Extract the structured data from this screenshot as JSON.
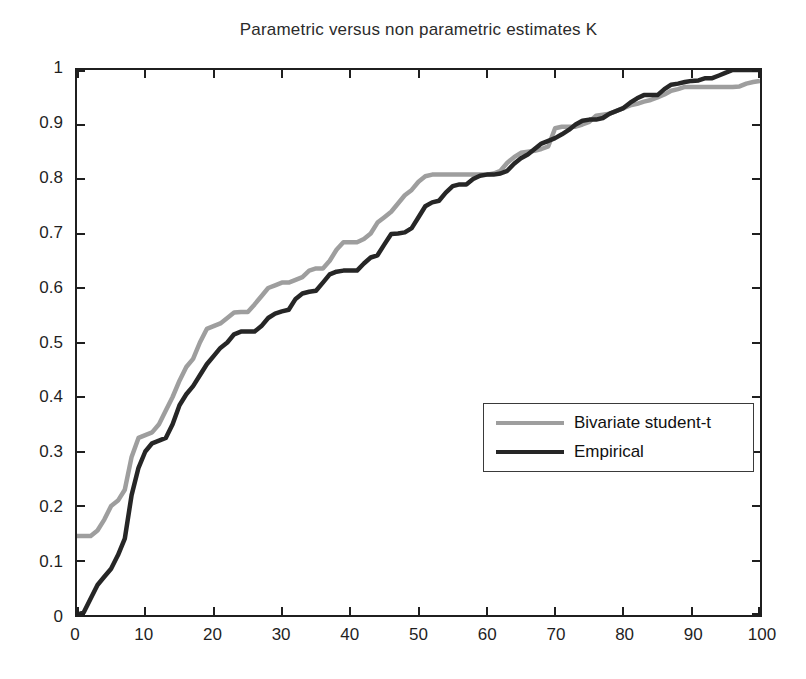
{
  "title": "Parametric versus non parametric estimates K",
  "legend": {
    "items": [
      {
        "label": "Bivariate student-t",
        "color": "#9e9e9e"
      },
      {
        "label": "Empirical",
        "color": "#262626"
      }
    ]
  },
  "axes": {
    "x": {
      "tick_values": [
        0,
        10,
        20,
        30,
        40,
        50,
        60,
        70,
        80,
        90,
        100
      ],
      "tick_labels": [
        "0",
        "10",
        "20",
        "30",
        "40",
        "50",
        "60",
        "70",
        "80",
        "90",
        "100"
      ]
    },
    "y": {
      "tick_values": [
        0,
        0.1,
        0.2,
        0.3,
        0.4,
        0.5,
        0.6,
        0.7,
        0.8,
        0.9,
        1
      ],
      "tick_labels": [
        "0",
        "0.1",
        "0.2",
        "0.3",
        "0.4",
        "0.5",
        "0.6",
        "0.7",
        "0.8",
        "0.9",
        "1"
      ]
    }
  },
  "chart_data": {
    "type": "line",
    "title": "Parametric versus non parametric estimates K",
    "xlabel": "",
    "ylabel": "",
    "xlim": [
      0,
      100
    ],
    "ylim": [
      0,
      1
    ],
    "grid": false,
    "legend_position": "inside lower-right",
    "frame_color": "#1f1f1f",
    "series": [
      {
        "name": "Bivariate student-t",
        "color": "#9e9e9e",
        "stroke_width": 4.5,
        "points": [
          [
            0,
            0.145
          ],
          [
            1,
            0.145
          ],
          [
            2,
            0.145
          ],
          [
            3,
            0.155
          ],
          [
            4,
            0.175
          ],
          [
            5,
            0.2
          ],
          [
            6,
            0.21
          ],
          [
            7,
            0.23
          ],
          [
            8,
            0.29
          ],
          [
            9,
            0.325
          ],
          [
            10,
            0.33
          ],
          [
            11,
            0.335
          ],
          [
            12,
            0.35
          ],
          [
            13,
            0.375
          ],
          [
            14,
            0.4
          ],
          [
            15,
            0.43
          ],
          [
            16,
            0.455
          ],
          [
            17,
            0.47
          ],
          [
            18,
            0.5
          ],
          [
            19,
            0.525
          ],
          [
            20,
            0.53
          ],
          [
            21,
            0.535
          ],
          [
            22,
            0.545
          ],
          [
            23,
            0.555
          ],
          [
            24,
            0.556
          ],
          [
            25,
            0.556
          ],
          [
            26,
            0.57
          ],
          [
            27,
            0.585
          ],
          [
            28,
            0.6
          ],
          [
            29,
            0.605
          ],
          [
            30,
            0.61
          ],
          [
            31,
            0.61
          ],
          [
            32,
            0.615
          ],
          [
            33,
            0.62
          ],
          [
            34,
            0.632
          ],
          [
            35,
            0.636
          ],
          [
            36,
            0.636
          ],
          [
            37,
            0.65
          ],
          [
            38,
            0.67
          ],
          [
            39,
            0.684
          ],
          [
            40,
            0.684
          ],
          [
            41,
            0.684
          ],
          [
            42,
            0.69
          ],
          [
            43,
            0.7
          ],
          [
            44,
            0.72
          ],
          [
            45,
            0.73
          ],
          [
            46,
            0.74
          ],
          [
            47,
            0.755
          ],
          [
            48,
            0.77
          ],
          [
            49,
            0.78
          ],
          [
            50,
            0.795
          ],
          [
            51,
            0.805
          ],
          [
            52,
            0.808
          ],
          [
            53,
            0.808
          ],
          [
            54,
            0.808
          ],
          [
            55,
            0.808
          ],
          [
            56,
            0.808
          ],
          [
            57,
            0.808
          ],
          [
            58,
            0.808
          ],
          [
            59,
            0.808
          ],
          [
            60,
            0.808
          ],
          [
            61,
            0.81
          ],
          [
            62,
            0.815
          ],
          [
            63,
            0.83
          ],
          [
            64,
            0.84
          ],
          [
            65,
            0.848
          ],
          [
            66,
            0.85
          ],
          [
            67,
            0.852
          ],
          [
            68,
            0.855
          ],
          [
            69,
            0.86
          ],
          [
            70,
            0.893
          ],
          [
            71,
            0.896
          ],
          [
            72,
            0.896
          ],
          [
            73,
            0.896
          ],
          [
            74,
            0.9
          ],
          [
            75,
            0.905
          ],
          [
            76,
            0.916
          ],
          [
            77,
            0.918
          ],
          [
            78,
            0.92
          ],
          [
            79,
            0.925
          ],
          [
            80,
            0.93
          ],
          [
            81,
            0.935
          ],
          [
            82,
            0.938
          ],
          [
            83,
            0.942
          ],
          [
            84,
            0.945
          ],
          [
            85,
            0.95
          ],
          [
            86,
            0.955
          ],
          [
            87,
            0.962
          ],
          [
            88,
            0.965
          ],
          [
            89,
            0.969
          ],
          [
            90,
            0.969
          ],
          [
            91,
            0.969
          ],
          [
            92,
            0.969
          ],
          [
            93,
            0.969
          ],
          [
            94,
            0.969
          ],
          [
            95,
            0.969
          ],
          [
            96,
            0.969
          ],
          [
            97,
            0.97
          ],
          [
            98,
            0.975
          ],
          [
            99,
            0.978
          ],
          [
            100,
            0.98
          ]
        ]
      },
      {
        "name": "Empirical",
        "color": "#262626",
        "stroke_width": 4.5,
        "points": [
          [
            0,
            0
          ],
          [
            1,
            0.005
          ],
          [
            2,
            0.03
          ],
          [
            3,
            0.055
          ],
          [
            4,
            0.07
          ],
          [
            5,
            0.085
          ],
          [
            6,
            0.11
          ],
          [
            7,
            0.14
          ],
          [
            8,
            0.22
          ],
          [
            9,
            0.27
          ],
          [
            10,
            0.3
          ],
          [
            11,
            0.315
          ],
          [
            12,
            0.32
          ],
          [
            13,
            0.325
          ],
          [
            14,
            0.35
          ],
          [
            15,
            0.385
          ],
          [
            16,
            0.405
          ],
          [
            17,
            0.42
          ],
          [
            18,
            0.44
          ],
          [
            19,
            0.46
          ],
          [
            20,
            0.475
          ],
          [
            21,
            0.49
          ],
          [
            22,
            0.5
          ],
          [
            23,
            0.515
          ],
          [
            24,
            0.52
          ],
          [
            25,
            0.52
          ],
          [
            26,
            0.52
          ],
          [
            27,
            0.53
          ],
          [
            28,
            0.545
          ],
          [
            29,
            0.553
          ],
          [
            30,
            0.557
          ],
          [
            31,
            0.56
          ],
          [
            32,
            0.58
          ],
          [
            33,
            0.59
          ],
          [
            34,
            0.593
          ],
          [
            35,
            0.595
          ],
          [
            36,
            0.61
          ],
          [
            37,
            0.625
          ],
          [
            38,
            0.63
          ],
          [
            39,
            0.632
          ],
          [
            40,
            0.632
          ],
          [
            41,
            0.632
          ],
          [
            42,
            0.645
          ],
          [
            43,
            0.656
          ],
          [
            44,
            0.66
          ],
          [
            45,
            0.68
          ],
          [
            46,
            0.699
          ],
          [
            47,
            0.7
          ],
          [
            48,
            0.702
          ],
          [
            49,
            0.71
          ],
          [
            50,
            0.73
          ],
          [
            51,
            0.75
          ],
          [
            52,
            0.757
          ],
          [
            53,
            0.76
          ],
          [
            54,
            0.775
          ],
          [
            55,
            0.787
          ],
          [
            56,
            0.79
          ],
          [
            57,
            0.79
          ],
          [
            58,
            0.8
          ],
          [
            59,
            0.806
          ],
          [
            60,
            0.808
          ],
          [
            61,
            0.808
          ],
          [
            62,
            0.81
          ],
          [
            63,
            0.815
          ],
          [
            64,
            0.828
          ],
          [
            65,
            0.838
          ],
          [
            66,
            0.845
          ],
          [
            67,
            0.855
          ],
          [
            68,
            0.865
          ],
          [
            69,
            0.87
          ],
          [
            70,
            0.875
          ],
          [
            71,
            0.882
          ],
          [
            72,
            0.89
          ],
          [
            73,
            0.9
          ],
          [
            74,
            0.907
          ],
          [
            75,
            0.909
          ],
          [
            76,
            0.909
          ],
          [
            77,
            0.912
          ],
          [
            78,
            0.92
          ],
          [
            79,
            0.925
          ],
          [
            80,
            0.93
          ],
          [
            81,
            0.94
          ],
          [
            82,
            0.948
          ],
          [
            83,
            0.954
          ],
          [
            84,
            0.954
          ],
          [
            85,
            0.954
          ],
          [
            86,
            0.965
          ],
          [
            87,
            0.973
          ],
          [
            88,
            0.975
          ],
          [
            89,
            0.978
          ],
          [
            90,
            0.98
          ],
          [
            91,
            0.981
          ],
          [
            92,
            0.985
          ],
          [
            93,
            0.985
          ],
          [
            94,
            0.99
          ],
          [
            95,
            0.995
          ],
          [
            96,
            1
          ],
          [
            97,
            1
          ],
          [
            98,
            1
          ],
          [
            99,
            1
          ],
          [
            100,
            1
          ]
        ]
      }
    ]
  }
}
